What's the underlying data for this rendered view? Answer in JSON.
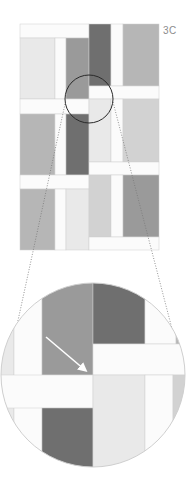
{
  "figure": {
    "label": "3C",
    "colors": {
      "white": "#fbfbfb",
      "light": "#e9e9e9",
      "light_gray": "#d2d2d2",
      "gray": "#b6b6b6",
      "mid_gray": "#9a9a9a",
      "dark": "#6f6f6f",
      "outline": "#cfcfcf",
      "circle_stroke": "#2a2a2a",
      "dotted": "#777777",
      "arrow": "#ffffff"
    },
    "pattern": {
      "bounds": {
        "x": 20,
        "y": 24,
        "w": 139,
        "h": 226
      },
      "blocks": [
        {
          "x": 20,
          "y": 24,
          "w": 69,
          "h": 14,
          "fill": "white"
        },
        {
          "x": 20,
          "y": 38,
          "w": 35,
          "h": 61,
          "fill": "light"
        },
        {
          "x": 55,
          "y": 38,
          "w": 11,
          "h": 61,
          "fill": "white"
        },
        {
          "x": 66,
          "y": 38,
          "w": 23,
          "h": 61,
          "fill": "mid_gray"
        },
        {
          "x": 89,
          "y": 24,
          "w": 22,
          "h": 62,
          "fill": "dark"
        },
        {
          "x": 111,
          "y": 24,
          "w": 12,
          "h": 62,
          "fill": "white"
        },
        {
          "x": 123,
          "y": 24,
          "w": 36,
          "h": 62,
          "fill": "gray"
        },
        {
          "x": 89,
          "y": 86,
          "w": 70,
          "h": 13,
          "fill": "white"
        },
        {
          "x": 20,
          "y": 99,
          "w": 69,
          "h": 15,
          "fill": "white"
        },
        {
          "x": 20,
          "y": 114,
          "w": 35,
          "h": 61,
          "fill": "gray"
        },
        {
          "x": 55,
          "y": 114,
          "w": 11,
          "h": 61,
          "fill": "white"
        },
        {
          "x": 66,
          "y": 114,
          "w": 23,
          "h": 61,
          "fill": "dark"
        },
        {
          "x": 89,
          "y": 99,
          "w": 22,
          "h": 63,
          "fill": "light"
        },
        {
          "x": 111,
          "y": 99,
          "w": 12,
          "h": 63,
          "fill": "white"
        },
        {
          "x": 123,
          "y": 99,
          "w": 36,
          "h": 63,
          "fill": "light_gray"
        },
        {
          "x": 89,
          "y": 162,
          "w": 70,
          "h": 13,
          "fill": "white"
        },
        {
          "x": 20,
          "y": 175,
          "w": 69,
          "h": 14,
          "fill": "white"
        },
        {
          "x": 20,
          "y": 189,
          "w": 35,
          "h": 61,
          "fill": "gray"
        },
        {
          "x": 55,
          "y": 189,
          "w": 11,
          "h": 61,
          "fill": "white"
        },
        {
          "x": 66,
          "y": 189,
          "w": 23,
          "h": 61,
          "fill": "light"
        },
        {
          "x": 89,
          "y": 175,
          "w": 22,
          "h": 62,
          "fill": "light_gray"
        },
        {
          "x": 111,
          "y": 175,
          "w": 12,
          "h": 62,
          "fill": "white"
        },
        {
          "x": 123,
          "y": 175,
          "w": 36,
          "h": 62,
          "fill": "mid_gray"
        },
        {
          "x": 89,
          "y": 237,
          "w": 70,
          "h": 13,
          "fill": "white"
        }
      ],
      "focus_circle": {
        "cx": 89,
        "cy": 99,
        "r": 24
      }
    },
    "magnified": {
      "circle": {
        "cx": 93,
        "cy": 375,
        "r": 92
      },
      "blocks": [
        {
          "x": 0,
          "y": 280,
          "w": 14,
          "h": 200,
          "fill": "light"
        },
        {
          "x": 14,
          "y": 280,
          "w": 28,
          "h": 200,
          "fill": "white"
        },
        {
          "x": 42,
          "y": 280,
          "w": 51,
          "h": 95,
          "fill": "mid_gray"
        },
        {
          "x": 93,
          "y": 280,
          "w": 52,
          "h": 64,
          "fill": "dark"
        },
        {
          "x": 145,
          "y": 280,
          "w": 31,
          "h": 64,
          "fill": "white"
        },
        {
          "x": 176,
          "y": 280,
          "w": 10,
          "h": 64,
          "fill": "gray"
        },
        {
          "x": 93,
          "y": 344,
          "w": 93,
          "h": 31,
          "fill": "white"
        },
        {
          "x": 0,
          "y": 375,
          "w": 93,
          "h": 33,
          "fill": "white"
        },
        {
          "x": 42,
          "y": 408,
          "w": 51,
          "h": 75,
          "fill": "dark"
        },
        {
          "x": 93,
          "y": 375,
          "w": 52,
          "h": 108,
          "fill": "light"
        },
        {
          "x": 145,
          "y": 375,
          "w": 28,
          "h": 108,
          "fill": "white"
        },
        {
          "x": 173,
          "y": 375,
          "w": 13,
          "h": 108,
          "fill": "light_gray"
        }
      ],
      "arrow": {
        "x1": 46,
        "y1": 337,
        "x2": 85,
        "y2": 370
      }
    },
    "connector_lines": [
      {
        "x1": 65,
        "y1": 104,
        "x2": 9,
        "y2": 362
      },
      {
        "x1": 113,
        "y1": 102,
        "x2": 177,
        "y2": 348
      }
    ]
  }
}
